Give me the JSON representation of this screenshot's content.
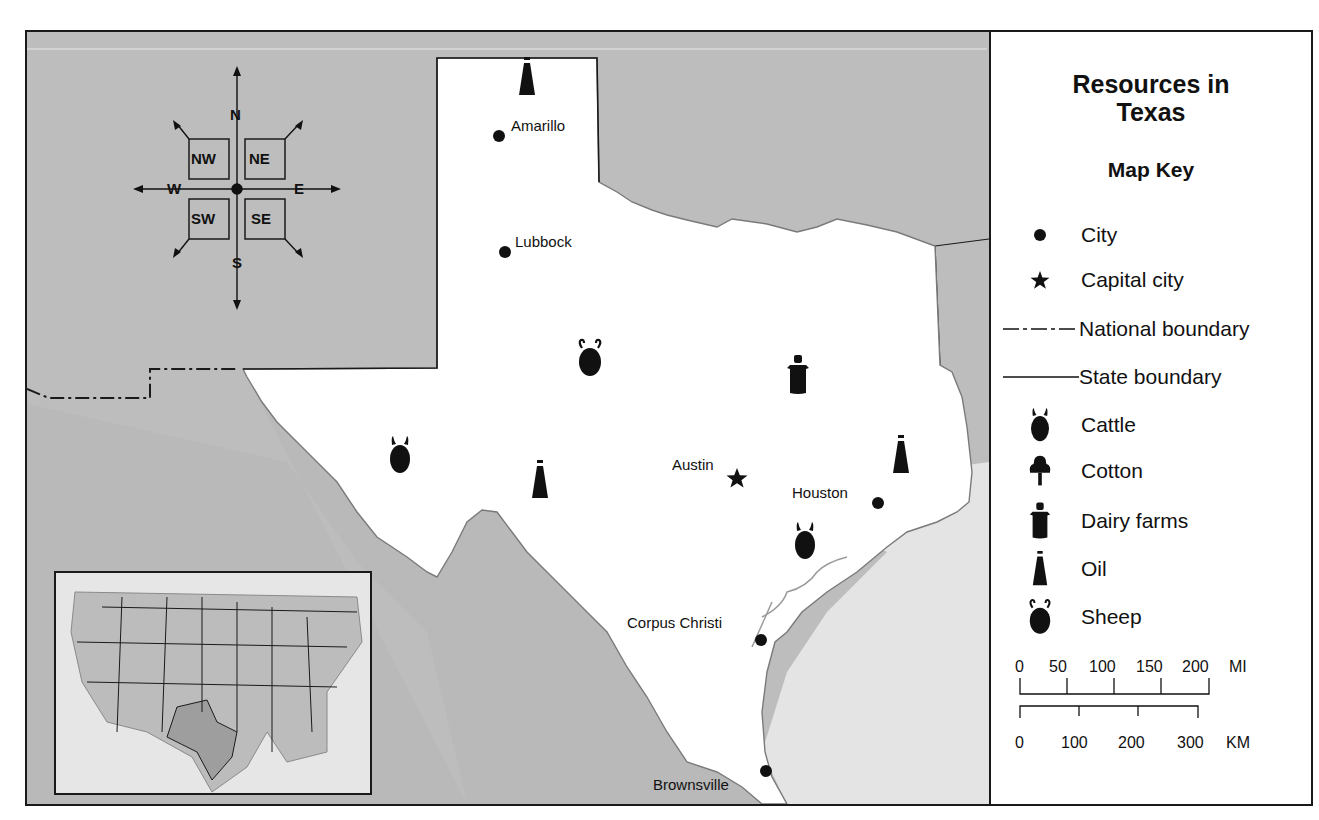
{
  "map": {
    "title": "Resources in Texas",
    "title_line1": "Resources in",
    "title_line2": "Texas",
    "colors": {
      "land_outside": "#bdbdbd",
      "texas": "#ffffff",
      "water": "#e6e6e6",
      "border": "#1a1a1a",
      "inset_texas": "#9e9e9e",
      "inset_states": "#bcbcbc"
    },
    "compass": {
      "cardinals": {
        "n": "N",
        "s": "S",
        "e": "E",
        "w": "W"
      },
      "intermediates": {
        "nw": "NW",
        "ne": "NE",
        "sw": "SW",
        "se": "SE"
      }
    },
    "cities": [
      {
        "name": "Amarillo",
        "type": "city"
      },
      {
        "name": "Lubbock",
        "type": "city"
      },
      {
        "name": "Austin",
        "type": "capital"
      },
      {
        "name": "Houston",
        "type": "city"
      },
      {
        "name": "Corpus Christi",
        "type": "city"
      },
      {
        "name": "Brownsville",
        "type": "city"
      }
    ],
    "resources": [
      {
        "type": "oil",
        "region": "panhandle"
      },
      {
        "type": "sheep",
        "region": "central-west"
      },
      {
        "type": "dairy-farms",
        "region": "north-central"
      },
      {
        "type": "cattle",
        "region": "far-west"
      },
      {
        "type": "oil",
        "region": "west"
      },
      {
        "type": "oil",
        "region": "east"
      },
      {
        "type": "cattle",
        "region": "southeast"
      }
    ],
    "inset": {
      "label": "United States locator map",
      "highlighted_state": "Texas"
    }
  },
  "legend": {
    "heading": "Map Key",
    "items": [
      {
        "symbol": "city-dot",
        "label": "City"
      },
      {
        "symbol": "star",
        "label": "Capital city"
      },
      {
        "symbol": "dash-dot-line",
        "label": "National boundary"
      },
      {
        "symbol": "solid-line",
        "label": "State boundary"
      },
      {
        "symbol": "cattle",
        "label": "Cattle"
      },
      {
        "symbol": "cotton",
        "label": "Cotton"
      },
      {
        "symbol": "dairy-farms",
        "label": "Dairy farms"
      },
      {
        "symbol": "oil",
        "label": "Oil"
      },
      {
        "symbol": "sheep",
        "label": "Sheep"
      }
    ],
    "scale": {
      "miles": {
        "ticks": [
          "0",
          "50",
          "100",
          "150",
          "200"
        ],
        "unit": "MI"
      },
      "km": {
        "ticks": [
          "0",
          "100",
          "200",
          "300"
        ],
        "unit": "KM"
      }
    }
  }
}
